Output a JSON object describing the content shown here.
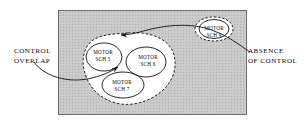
{
  "figure": {
    "background_color": "#ffffff",
    "field_fill": "#c9c9c9",
    "blob_fill": "#ffffff",
    "stroke_color": "#111111"
  },
  "annotations": {
    "control_overlap": {
      "line1": "CONTROL",
      "line2": "OVERLAP"
    },
    "absence_of_control": {
      "line1": "ABSENCE",
      "line2": "OF CONTROL"
    }
  },
  "nodes": [
    {
      "id": "sch5",
      "line1": "MOTOR",
      "line2": "SCH 5"
    },
    {
      "id": "sch6",
      "line1": "MOTOR",
      "line2": "SCH 6"
    },
    {
      "id": "sch7",
      "line1": "MOTOR",
      "line2": "SCH 7"
    },
    {
      "id": "sch9",
      "line1": "MOTOR",
      "line2": "SCH 9"
    }
  ]
}
